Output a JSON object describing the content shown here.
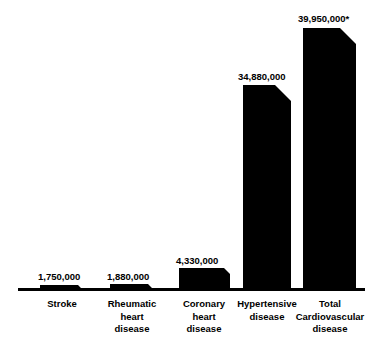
{
  "chart_data": {
    "type": "bar",
    "title": "",
    "subtitle": "",
    "xlabel": "",
    "ylabel": "",
    "grid": false,
    "legend": false,
    "legend_position": "none",
    "orientation": "vertical",
    "bar_color": "#000000",
    "axis_color": "#000000",
    "background": "#ffffff",
    "ylim": [
      0,
      39950000
    ],
    "categories": [
      "Stroke",
      "Rheumatic\nheart\ndisease",
      "Coronary\nheart\ndisease",
      "Hypertensive\ndisease",
      "Total\nCardiovascular\ndisease"
    ],
    "values": [
      1750000,
      1880000,
      4330000,
      34880000,
      39950000
    ],
    "value_labels": [
      "1,750,000",
      "1,880,000",
      "4,330,000",
      "34,880,000",
      "39,950,000*"
    ],
    "annotations": [
      "* Total Cardiovascular disease figure is marked with an asterisk"
    ]
  },
  "bars": [
    {
      "name": "stroke",
      "value_label": "1,750,000",
      "category_label": "Stroke",
      "x": 40,
      "width": 44,
      "top": 285,
      "label_x": 38,
      "label_y": 272,
      "cat_x": 22,
      "cat_y": 298,
      "cat_width": 80
    },
    {
      "name": "rheumatic-heart-disease",
      "value_label": "1,880,000",
      "category_label": "Rheumatic\nheart\ndisease",
      "x": 110,
      "width": 44,
      "top": 284,
      "label_x": 107,
      "label_y": 272,
      "cat_x": 92,
      "cat_y": 298,
      "cat_width": 80
    },
    {
      "name": "coronary-heart-disease",
      "value_label": "4,330,000",
      "category_label": "Coronary\nheart\ndisease",
      "x": 179,
      "width": 51,
      "top": 268,
      "label_x": 176,
      "label_y": 256,
      "cat_x": 164,
      "cat_y": 298,
      "cat_width": 80
    },
    {
      "name": "hypertensive-disease",
      "value_label": "34,880,000",
      "category_label": "Hypertensive\ndisease",
      "x": 243,
      "width": 48,
      "top": 85,
      "label_x": 238,
      "label_y": 72,
      "cat_x": 227,
      "cat_y": 298,
      "cat_width": 80
    },
    {
      "name": "total-cardiovascular-disease",
      "value_label": "39,950,000*",
      "category_label": "Total\nCardiovascular\ndisease",
      "x": 303,
      "width": 53,
      "top": 28,
      "label_x": 298,
      "label_y": 14,
      "cat_x": 288,
      "cat_y": 298,
      "cat_width": 84
    }
  ],
  "axis": {
    "name": "baseline-axis",
    "x": 18,
    "y": 288,
    "width": 347,
    "height": 3
  }
}
